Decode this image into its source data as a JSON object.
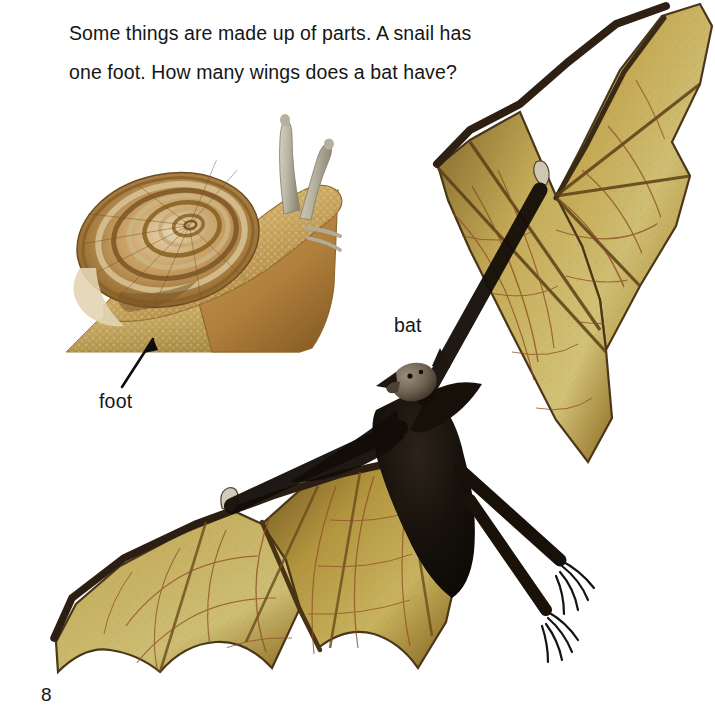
{
  "page": {
    "number": "8",
    "background_color": "#ffffff",
    "width": 715,
    "height": 721
  },
  "lesson": {
    "text": "Some things are made up of parts. A snail has\none foot. How many wings does a bat have?",
    "line1": "Some things are made up of parts. A snail has",
    "line2": "one foot. How many wings does a bat have?",
    "text_color": "#161616"
  },
  "labels": [
    {
      "id": "foot",
      "text": "foot",
      "points_to": "snail-foot",
      "has_leader_arrow": true
    },
    {
      "id": "bat",
      "text": "bat",
      "points_to": "bat-photo",
      "has_leader_arrow": false
    }
  ],
  "figures": [
    {
      "id": "snail-photo",
      "name": "snail",
      "alt": "Photograph of a garden snail with a coiled striped shell, two raised tentacles and a large muscular foot",
      "bounds": {
        "x": 62,
        "y": 108,
        "w": 285,
        "h": 252
      },
      "parts": [
        "shell",
        "head",
        "upper-tentacles",
        "lower-tentacles",
        "foot"
      ],
      "colors": {
        "shell_light": "#e3cfa6",
        "shell_mid": "#b98f54",
        "shell_dark": "#7d5428",
        "shell_band": "#8d6330",
        "body_light": "#d9c083",
        "body_mid": "#c49a55",
        "body_dark": "#9a7233",
        "tentacle": "#bdb9a8",
        "foot_sole": "#cdb76f"
      }
    },
    {
      "id": "bat-photo",
      "name": "bat",
      "alt": "Photograph of a flying fox bat in flight with both wings spread, dark body and olive-yellow wing membranes showing veins",
      "bounds": {
        "x": 55,
        "y": 2,
        "w": 660,
        "h": 675
      },
      "parts": [
        "head",
        "ears",
        "body",
        "left-wing",
        "right-wing",
        "thumb-claws",
        "feet-claws"
      ],
      "wing_count": 2,
      "colors": {
        "membrane_light": "#d3c16a",
        "membrane_mid": "#bb9a45",
        "membrane_dark": "#8a6a23",
        "membrane_edge": "#3b2a12",
        "vein": "#8c4a22",
        "body_dark": "#14100c",
        "body_fur": "#3a2a1c",
        "head": "#7a6e5e",
        "claw": "#1b1b1b"
      }
    }
  ],
  "arrow": {
    "name": "foot-leader-arrow",
    "color": "#0d0d0d",
    "from": {
      "x": 122,
      "y": 387
    },
    "to": {
      "x": 153,
      "y": 338
    }
  },
  "answer_hint": {
    "question": "How many wings does a bat have?",
    "wings": 2
  }
}
